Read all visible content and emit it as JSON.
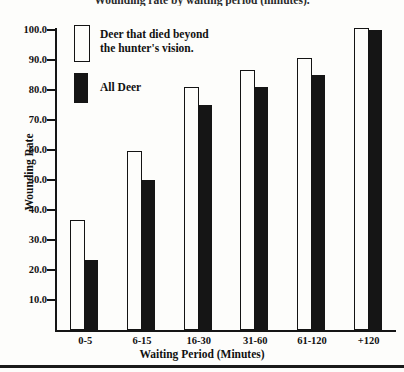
{
  "chart_data": {
    "type": "bar",
    "title": "Wounding rate by waiting period (minutes).",
    "xlabel": "Waiting Period (Minutes)",
    "ylabel": "Wounding Rate",
    "categories": [
      "0-5",
      "6-15",
      "16-30",
      "31-60",
      "61-120",
      "+120"
    ],
    "series": [
      {
        "name": "Deer that died beyond the hunter's vision.",
        "color": "#ffffff",
        "values": [
          36.0,
          59.0,
          80.5,
          86.0,
          90.0,
          100.0
        ]
      },
      {
        "name": "All Deer",
        "color": "#151515",
        "values": [
          23.5,
          50.0,
          75.0,
          81.0,
          85.0,
          100.0
        ]
      }
    ],
    "ylim": [
      0,
      100
    ],
    "ytick_labels": [
      "100.0",
      "90.0",
      "80.0",
      "70.0",
      "60.0",
      "50.0",
      "40.0",
      "30.0",
      "20.0",
      "10.0"
    ],
    "ytick_values": [
      100,
      90,
      80,
      70,
      60,
      50,
      40,
      30,
      20,
      10
    ],
    "grid": false,
    "legend_position": "top-left"
  },
  "legend": {
    "entry_light": "Deer that died beyond\nthe hunter's vision.",
    "entry_dark": "All Deer"
  }
}
